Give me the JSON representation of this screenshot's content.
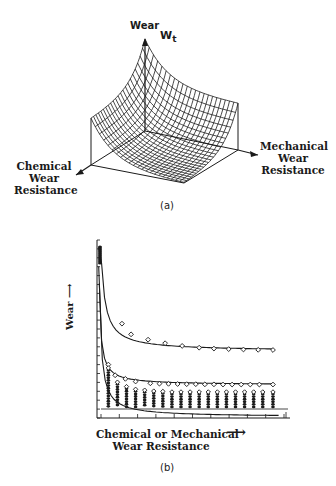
{
  "figure_a": {
    "caption": "(a)",
    "z_axis_label": "Wear",
    "surface_label_main": "W",
    "surface_label_sub": "t",
    "left_axis_label": [
      "Chemical",
      "Wear",
      "Resistance"
    ],
    "right_axis_label": [
      "Mechanical",
      "Wear",
      "Resistance"
    ],
    "geometry": {
      "origin": [
        145,
        131
      ],
      "z_top": [
        145,
        38
      ],
      "left_corner": [
        91,
        165
      ],
      "right_corner": [
        238,
        150
      ],
      "front_corner": [
        184,
        183
      ],
      "left_arrow_tip": [
        76,
        175
      ],
      "right_arrow_tip": [
        258,
        155
      ],
      "peak_height": 92,
      "edge_height": 46,
      "grid_lines": 22
    }
  },
  "figure_b": {
    "caption": "(b)",
    "y_axis_label": "Wear",
    "x_axis_label": [
      "Chemical or Mechanical",
      "Wear Resistance"
    ]
  },
  "chart_data": {
    "type": "scatter",
    "title": "",
    "xlabel": "Chemical or Mechanical Wear Resistance",
    "ylabel": "Wear",
    "grid": false,
    "series": [
      {
        "name": "upper curve",
        "x": [
          2.2,
          3.0,
          4.5,
          6.0,
          7.5,
          9.0,
          10.3,
          11.6,
          12.9,
          14.2,
          15.5
        ],
        "y": [
          5.3,
          4.7,
          4.4,
          4.2,
          4.05,
          3.95,
          3.9,
          3.87,
          3.85,
          3.83,
          3.82
        ]
      },
      {
        "name": "middle curve",
        "x": [
          1.0,
          1.6,
          2.5,
          3.4,
          4.7,
          5.5,
          6.3,
          7.1,
          7.9,
          8.7,
          9.5,
          10.3,
          11.1,
          11.9,
          12.7,
          13.5,
          14.3,
          15.5
        ],
        "y": [
          3.0,
          2.4,
          2.2,
          2.05,
          1.95,
          1.93,
          1.92,
          1.91,
          1.9,
          1.9,
          1.89,
          1.89,
          1.88,
          1.88,
          1.88,
          1.88,
          1.88,
          1.88
        ]
      },
      {
        "name": "lower scatter clusters",
        "x": [
          1.0,
          1.8,
          2.6,
          3.4,
          4.2,
          5.0,
          5.8,
          6.6,
          7.4,
          8.2,
          9.0,
          9.8,
          10.6,
          11.4,
          12.2,
          13.0,
          13.8,
          14.6,
          15.5
        ],
        "y": [
          2.3,
          1.5,
          1.25,
          1.1,
          1.05,
          1.0,
          0.98,
          0.95,
          0.95,
          0.95,
          0.95,
          0.95,
          0.95,
          0.95,
          0.95,
          0.95,
          0.95,
          0.95,
          0.95
        ]
      },
      {
        "name": "lower envelope curve",
        "x": [
          0.2,
          0.5,
          1.0,
          2.0,
          4.0,
          8.0,
          16.0
        ],
        "y": [
          9.5,
          4.0,
          1.6,
          0.8,
          0.35,
          0.15,
          0.07
        ]
      }
    ],
    "xlim": [
      0,
      17
    ],
    "ylim": [
      0,
      10
    ],
    "x_ticks": 11,
    "y_ticks": 21
  }
}
